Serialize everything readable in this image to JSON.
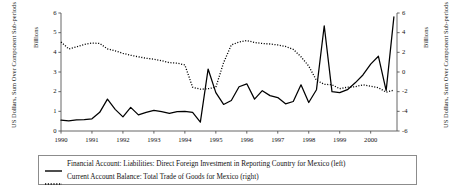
{
  "chart_data": {
    "type": "line",
    "title": "",
    "xlabel": "",
    "x": [
      1990,
      1990.25,
      1990.5,
      1990.75,
      1991,
      1991.25,
      1991.5,
      1991.75,
      1992,
      1992.25,
      1992.5,
      1992.75,
      1993,
      1993.25,
      1993.5,
      1993.75,
      1994,
      1994.25,
      1994.5,
      1994.75,
      1995,
      1995.25,
      1995.5,
      1995.75,
      1996,
      1996.25,
      1996.5,
      1996.75,
      1997,
      1997.25,
      1997.5,
      1997.75,
      1998,
      1998.25,
      1998.5,
      1998.75,
      1999,
      1999.25,
      1999.5,
      1999.75,
      2000,
      2000.25,
      2000.5,
      2000.75
    ],
    "xtick_labels": [
      "1990",
      "1991",
      "1992",
      "1993",
      "1994",
      "1995",
      "1996",
      "1997",
      "1998",
      "1999",
      "2000"
    ],
    "xtick_values": [
      1990,
      1991,
      1992,
      1993,
      1994,
      1995,
      1996,
      1997,
      1998,
      1999,
      2000
    ],
    "xlim": [
      1990,
      2000.85
    ],
    "grid": false,
    "legend_position": "below-plot",
    "left_axis": {
      "unit_label": "Billions",
      "title": "US Dollars, Sum Over Component Sub-periods",
      "ticks": [
        0,
        1,
        2,
        3,
        4,
        5,
        6
      ],
      "tick_labels": [
        "0",
        "1",
        "2",
        "3",
        "4",
        "5",
        "6"
      ],
      "ylim": [
        0,
        6
      ]
    },
    "right_axis": {
      "unit_label": "Billions",
      "title": "US Dollars, Sum Over Component Sub-periods",
      "ticks": [
        -6,
        -4,
        -2,
        0,
        2,
        4,
        6
      ],
      "tick_labels": [
        "-6",
        "-4",
        "-2",
        "0",
        "2",
        "4",
        "6"
      ],
      "ylim": [
        -6,
        6
      ]
    },
    "series": [
      {
        "name": "Financial Account: Liabilities: Direct Foreign Investment in Reporting Country for Mexico (left)",
        "axis": "left",
        "style": "solid",
        "color": "#000000",
        "values": [
          0.55,
          0.52,
          0.56,
          0.58,
          0.62,
          0.95,
          1.62,
          1.1,
          0.72,
          1.2,
          0.82,
          0.95,
          1.05,
          0.98,
          0.9,
          0.98,
          1.0,
          0.95,
          0.45,
          3.15,
          1.95,
          1.35,
          1.55,
          2.25,
          2.4,
          1.62,
          2.05,
          1.8,
          1.7,
          1.38,
          1.5,
          2.35,
          1.45,
          2.1,
          5.35,
          2.0,
          1.95,
          2.1,
          2.45,
          2.85,
          3.4,
          3.8,
          2.05,
          5.8
        ]
      },
      {
        "name": "Current Account Balance: Total Trade of Goods for Mexico (right)",
        "axis": "right",
        "style": "dotted",
        "color": "#000000",
        "values": [
          3.05,
          2.35,
          2.55,
          2.8,
          2.95,
          2.9,
          2.35,
          2.15,
          1.9,
          1.7,
          1.55,
          1.4,
          1.3,
          1.15,
          0.95,
          0.9,
          0.72,
          -1.55,
          -1.75,
          -1.7,
          -1.55,
          0.95,
          2.75,
          3.05,
          3.2,
          3.0,
          2.9,
          2.85,
          2.75,
          2.6,
          2.3,
          1.55,
          0.6,
          -0.85,
          -1.25,
          -1.3,
          -1.7,
          -1.55,
          -1.5,
          -1.3,
          -1.45,
          -1.6,
          -2.05,
          -1.85
        ]
      }
    ]
  },
  "axes": {
    "left_unit": "Billions",
    "left_title": "US Dollars, Sum Over Component Sub-periods",
    "right_unit": "Billions",
    "right_title": "US Dollars, Sum Over Component Sub-periods"
  },
  "legend": {
    "entries": [
      {
        "label": "Financial Account: Liabilities: Direct Foreign Investment in Reporting Country for Mexico (left)",
        "marker": "solid-line-swatch"
      },
      {
        "label": "Current Account Balance: Total Trade of Goods for Mexico (right)",
        "marker": "dotted-line-swatch"
      }
    ]
  }
}
